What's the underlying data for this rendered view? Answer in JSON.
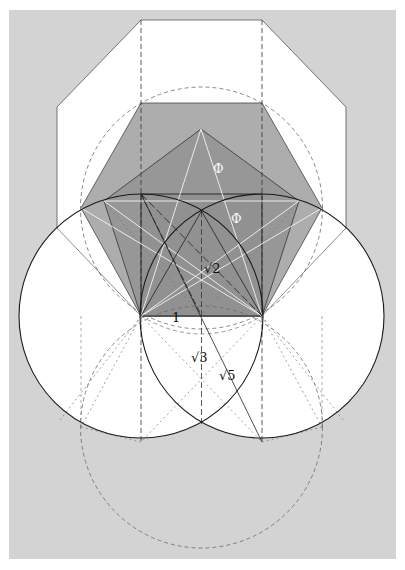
{
  "figure": {
    "colors": {
      "page": "#ffffff",
      "background": "#d3d3d3",
      "octagon_fill": "#ffffff",
      "hexagon_fill": "#a9a9a9",
      "pentagon_fill": "#939393",
      "square_fill": "#8a8a8a",
      "line_dark": "#1a1a1a",
      "line_light": "#f2f2f2",
      "dashed": "#6a6a6a"
    },
    "labels": {
      "phi_1": "Φ",
      "phi_2": "Φ",
      "sqrt2": "√2",
      "one": "1",
      "sqrt3": "√3",
      "sqrt5": "√5"
    }
  }
}
